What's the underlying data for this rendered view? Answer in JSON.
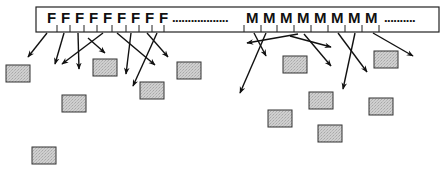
{
  "diagram": {
    "bar": {
      "x": 36,
      "y": 7,
      "width": 403,
      "height": 25
    },
    "f_labels": [
      {
        "text": "F",
        "x": 47
      },
      {
        "text": "F",
        "x": 61
      },
      {
        "text": "F",
        "x": 75
      },
      {
        "text": "F",
        "x": 89
      },
      {
        "text": "F",
        "x": 103
      },
      {
        "text": "F",
        "x": 117
      },
      {
        "text": "F",
        "x": 131
      },
      {
        "text": "F",
        "x": 145
      },
      {
        "text": "F",
        "x": 159
      }
    ],
    "dots_1": {
      "text": "..................",
      "x": 172
    },
    "m_labels": [
      {
        "text": "M",
        "x": 246
      },
      {
        "text": "M",
        "x": 263
      },
      {
        "text": "M",
        "x": 280
      },
      {
        "text": "M",
        "x": 297
      },
      {
        "text": "M",
        "x": 314
      },
      {
        "text": "M",
        "x": 331
      },
      {
        "text": "M",
        "x": 348
      },
      {
        "text": "M",
        "x": 365
      }
    ],
    "dots_2": {
      "text": "..........",
      "x": 384
    },
    "ticks_x": [
      57,
      70,
      84,
      97,
      112,
      126,
      139,
      152,
      164,
      244,
      261,
      277,
      294,
      311,
      328,
      345,
      362,
      379
    ],
    "boxes": [
      {
        "x": 6,
        "y": 65,
        "w": 24,
        "h": 17
      },
      {
        "x": 93,
        "y": 59,
        "w": 24,
        "h": 17
      },
      {
        "x": 62,
        "y": 95,
        "w": 24,
        "h": 17
      },
      {
        "x": 140,
        "y": 82,
        "w": 24,
        "h": 17
      },
      {
        "x": 177,
        "y": 62,
        "w": 24,
        "h": 17
      },
      {
        "x": 32,
        "y": 147,
        "w": 24,
        "h": 17
      },
      {
        "x": 283,
        "y": 56,
        "w": 24,
        "h": 17
      },
      {
        "x": 374,
        "y": 51,
        "w": 24,
        "h": 17
      },
      {
        "x": 268,
        "y": 110,
        "w": 24,
        "h": 17
      },
      {
        "x": 309,
        "y": 92,
        "w": 24,
        "h": 17
      },
      {
        "x": 369,
        "y": 98,
        "w": 24,
        "h": 17
      },
      {
        "x": 318,
        "y": 125,
        "w": 24,
        "h": 17
      }
    ],
    "arrows": [
      {
        "x1": 47,
        "y1": 33,
        "x2": 28,
        "y2": 57
      },
      {
        "x1": 64,
        "y1": 33,
        "x2": 55,
        "y2": 64
      },
      {
        "x1": 78,
        "y1": 33,
        "x2": 79,
        "y2": 69
      },
      {
        "x1": 103,
        "y1": 33,
        "x2": 62,
        "y2": 64
      },
      {
        "x1": 88,
        "y1": 38,
        "x2": 105,
        "y2": 53
      },
      {
        "x1": 131,
        "y1": 33,
        "x2": 126,
        "y2": 74
      },
      {
        "x1": 117,
        "y1": 33,
        "x2": 155,
        "y2": 65
      },
      {
        "x1": 157,
        "y1": 33,
        "x2": 133,
        "y2": 86
      },
      {
        "x1": 147,
        "y1": 33,
        "x2": 168,
        "y2": 57
      },
      {
        "x1": 254,
        "y1": 33,
        "x2": 266,
        "y2": 56
      },
      {
        "x1": 266,
        "y1": 33,
        "x2": 240,
        "y2": 93
      },
      {
        "x1": 298,
        "y1": 34,
        "x2": 247,
        "y2": 43
      },
      {
        "x1": 290,
        "y1": 36,
        "x2": 331,
        "y2": 47
      },
      {
        "x1": 304,
        "y1": 34,
        "x2": 331,
        "y2": 66
      },
      {
        "x1": 338,
        "y1": 33,
        "x2": 367,
        "y2": 72
      },
      {
        "x1": 355,
        "y1": 33,
        "x2": 343,
        "y2": 89
      },
      {
        "x1": 373,
        "y1": 33,
        "x2": 413,
        "y2": 56
      }
    ]
  }
}
